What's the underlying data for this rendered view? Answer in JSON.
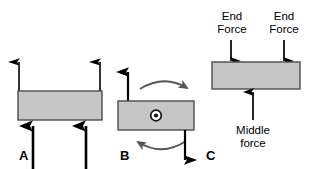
{
  "figure": {
    "background_color": "#ffffff",
    "width": 310,
    "height": 169
  },
  "style": {
    "bar_fill": "#c6c6c6",
    "bar_stroke": "#4d4d4d",
    "arrow_color": "#000000",
    "curve_color": "#555555",
    "text_color": "#000000"
  },
  "panels": [
    {
      "id": "A",
      "label": "A",
      "bar": {
        "note": "horizontal rectangular beam"
      },
      "forces": [
        {
          "name": "upward-arrow-above-left",
          "direction": "up",
          "style": "thin"
        },
        {
          "name": "upward-arrow-above-right",
          "direction": "up",
          "style": "thin"
        },
        {
          "name": "upward-arrow-below-left",
          "direction": "up",
          "style": "thick"
        },
        {
          "name": "upward-arrow-below-right",
          "direction": "up",
          "style": "thick"
        }
      ],
      "annotations": []
    },
    {
      "id": "B",
      "label": "B",
      "bar": {
        "note": "horizontal rectangular beam with out-of-page vector marker"
      },
      "center_symbol": "circle-dot",
      "forces": [
        {
          "name": "upward-arrow-left",
          "direction": "up"
        },
        {
          "name": "downward-arrow-right",
          "direction": "down"
        }
      ],
      "annotations": [
        {
          "name": "rotation-arc-top",
          "direction": "clockwise-right"
        },
        {
          "name": "rotation-arc-bottom",
          "direction": "counterclockwise-left"
        }
      ]
    },
    {
      "id": "C",
      "label": "C",
      "bar": {
        "note": "horizontal rectangular beam"
      },
      "forces": [
        {
          "name": "end-force-left",
          "direction": "down",
          "label": "End Force"
        },
        {
          "name": "end-force-right",
          "direction": "down",
          "label": "End Force"
        },
        {
          "name": "middle-force",
          "direction": "up",
          "label": "Middle force"
        }
      ],
      "labels": {
        "end_force_left_line1": "End",
        "end_force_left_line2": "Force",
        "end_force_right_line1": "End",
        "end_force_right_line2": "Force",
        "middle_force_line1": "Middle",
        "middle_force_line2": "force"
      }
    }
  ]
}
